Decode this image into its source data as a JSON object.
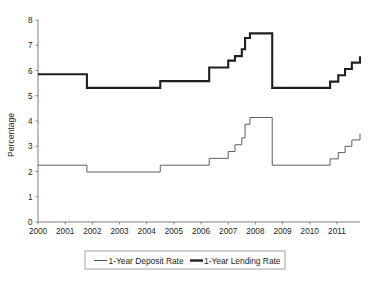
{
  "chart_data": {
    "type": "line",
    "title": "",
    "subtitle": "",
    "xlabel": "",
    "ylabel": "Percentage",
    "xlim": [
      2000,
      2011.85
    ],
    "ylim": [
      0,
      8
    ],
    "grid": false,
    "step": "post",
    "legend_position": "bottom",
    "x_tick_labels": [
      "2000",
      "2001",
      "2002",
      "2003",
      "2004",
      "2005",
      "2006",
      "2007",
      "2008",
      "2009",
      "2010",
      "2011"
    ],
    "x_tick_values": [
      2000,
      2001,
      2002,
      2003,
      2004,
      2005,
      2006,
      2007,
      2008,
      2009,
      2010,
      2011
    ],
    "y_tick_labels": [
      "0",
      "1",
      "2",
      "3",
      "4",
      "5",
      "6",
      "7",
      "8"
    ],
    "y_tick_values": [
      0,
      1,
      2,
      3,
      4,
      5,
      6,
      7,
      8
    ],
    "series": [
      {
        "name": "1-Year Deposit Rate",
        "style": "thin",
        "color": "#4d4d4d",
        "x": [
          2000.0,
          2001.8,
          2004.5,
          2006.3,
          2006.65,
          2007.0,
          2007.25,
          2007.5,
          2007.62,
          2007.8,
          2008.62,
          2010.45,
          2010.75,
          2011.05,
          2011.3,
          2011.55,
          2011.85
        ],
        "values": [
          2.25,
          1.98,
          2.25,
          2.52,
          2.52,
          2.79,
          3.06,
          3.33,
          3.87,
          4.14,
          2.25,
          2.25,
          2.5,
          2.75,
          3.0,
          3.25,
          3.5
        ]
      },
      {
        "name": "1-Year Lending Rate",
        "style": "thick",
        "color": "#231f20",
        "x": [
          2000.0,
          2001.8,
          2004.5,
          2006.3,
          2006.65,
          2007.0,
          2007.25,
          2007.5,
          2007.62,
          2007.8,
          2008.62,
          2010.45,
          2010.75,
          2011.05,
          2011.3,
          2011.55,
          2011.85
        ],
        "values": [
          5.85,
          5.31,
          5.58,
          6.12,
          6.12,
          6.39,
          6.57,
          6.84,
          7.29,
          7.47,
          5.31,
          5.31,
          5.56,
          5.81,
          6.06,
          6.31,
          6.56
        ]
      }
    ],
    "legend_entries": [
      {
        "label": "1-Year Deposit Rate",
        "style": "thin"
      },
      {
        "label": "1-Year Lending Rate",
        "style": "thick"
      }
    ]
  }
}
